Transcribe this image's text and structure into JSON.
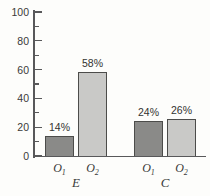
{
  "chart_data": {
    "type": "bar",
    "title": "",
    "xlabel": "",
    "ylabel": "",
    "ylim": [
      0,
      100
    ],
    "grid": false,
    "legend": "none",
    "y_axis": {
      "major_ticks": [
        0,
        20,
        40,
        60,
        80,
        100
      ],
      "major_tick_labels": [
        "0",
        "20",
        "40",
        "60",
        "80",
        "100"
      ],
      "minor_ticks": [
        10,
        30,
        50,
        70,
        90
      ]
    },
    "groups": [
      {
        "label": "E",
        "bars": [
          {
            "category_base": "O",
            "category_sub": "1",
            "value": 14,
            "value_label": "14%",
            "shade": "dark"
          },
          {
            "category_base": "O",
            "category_sub": "2",
            "value": 58,
            "value_label": "58%",
            "shade": "light"
          }
        ]
      },
      {
        "label": "C",
        "bars": [
          {
            "category_base": "O",
            "category_sub": "1",
            "value": 24,
            "value_label": "24%",
            "shade": "dark"
          },
          {
            "category_base": "O",
            "category_sub": "2",
            "value": 26,
            "value_label": "26%",
            "shade": "light"
          }
        ]
      }
    ],
    "colors": {
      "dark_bar": "#8a8a88",
      "light_bar": "#c9c9c7",
      "bar_border": "#4c4c4a",
      "axis": "#58585a",
      "text": "#3a3a38",
      "background": "#fdfdfb"
    }
  }
}
